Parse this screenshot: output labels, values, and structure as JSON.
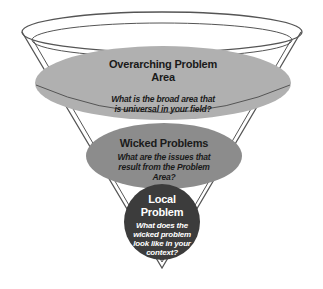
{
  "diagram": {
    "type": "funnel",
    "colors": {
      "outline": "#555555",
      "top_fill": "#b0b0b0",
      "middle_fill": "#8c8c8c",
      "bottom_fill": "#3c3c3c"
    },
    "levels": [
      {
        "title": "Overarching Problem Area",
        "title_line1": "Overarching Problem",
        "title_line2": "Area",
        "question_line1": "What is the broad area that",
        "question_line2": "is universal in your field?"
      },
      {
        "title": "Wicked Problems",
        "question_line1": "What are the issues that",
        "question_line2": "result from the Problem",
        "question_line3": "Area?"
      },
      {
        "title_line1": "Local",
        "title_line2": "Problem",
        "question_line1": "What does the",
        "question_line2": "wicked problem",
        "question_line3": "look like in your",
        "question_line4": "context?"
      }
    ]
  }
}
